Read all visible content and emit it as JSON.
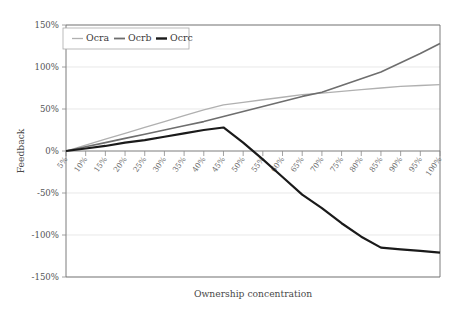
{
  "chart_data": {
    "type": "line",
    "title": "",
    "xlabel": "Ownership concentration",
    "ylabel": "Feedback",
    "ylim": [
      -150,
      150
    ],
    "ytick_labels": [
      "150%",
      "100%",
      "50%",
      "0%",
      "-50%",
      "-100%",
      "-150%"
    ],
    "ytick_values": [
      150,
      100,
      50,
      0,
      -50,
      -100,
      -150
    ],
    "grid": true,
    "legend_position": "top-left-inside",
    "categories": [
      "5%",
      "10%",
      "15%",
      "20%",
      "25%",
      "30%",
      "35%",
      "40%",
      "45%",
      "50%",
      "55%",
      "60%",
      "65%",
      "70%",
      "75%",
      "80%",
      "85%",
      "90%",
      "95%",
      "100%"
    ],
    "series": [
      {
        "name": "Ocra",
        "color": "#b0b0b0",
        "width": 1.3,
        "values": [
          0,
          7,
          14,
          21,
          28,
          35,
          42,
          49,
          55,
          58,
          61,
          64,
          67,
          69,
          71,
          73,
          75,
          77,
          78,
          79
        ]
      },
      {
        "name": "Ocrb",
        "color": "#6e6e6e",
        "width": 1.6,
        "values": [
          0,
          5,
          10,
          15,
          20,
          25,
          30,
          35,
          41,
          47,
          53,
          59,
          65,
          70,
          78,
          86,
          94,
          105,
          116,
          128
        ]
      },
      {
        "name": "Ocrc",
        "color": "#1a1a1a",
        "width": 2.2,
        "values": [
          0,
          3,
          6,
          10,
          13,
          17,
          21,
          25,
          28,
          10,
          -10,
          -31,
          -52,
          -68,
          -86,
          -102,
          -115,
          -117,
          -119,
          -121
        ]
      }
    ]
  },
  "legend": {
    "items": [
      {
        "label": "Ocra",
        "color": "#b0b0b0"
      },
      {
        "label": "Ocrb",
        "color": "#6e6e6e"
      },
      {
        "label": "Ocrc",
        "color": "#1a1a1a"
      }
    ]
  }
}
